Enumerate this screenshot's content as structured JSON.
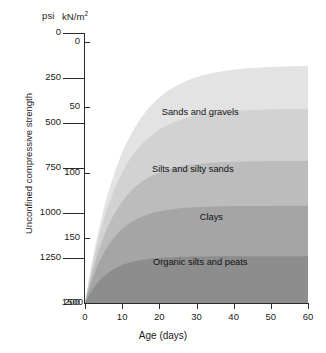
{
  "chart_data": {
    "type": "area",
    "title": "",
    "xlabel": "Age (days)",
    "ylabel": "Unconfined compressive strength",
    "xlim": [
      0,
      60
    ],
    "grid": false,
    "legend_position": "inline-band-labels",
    "x": [
      0,
      10,
      20,
      30,
      40,
      50,
      60
    ],
    "axes": [
      {
        "name": "psi",
        "unit_label": "psi",
        "side": "outer-left",
        "ticks": [
          0,
          250,
          500,
          750,
          1000,
          1250,
          1500
        ],
        "range": [
          0,
          1500
        ]
      },
      {
        "name": "kN/m2",
        "unit_label": "kN/m",
        "unit_sup": "2",
        "side": "inner-left",
        "ticks": [
          0,
          50,
          100,
          150,
          200
        ],
        "range": [
          0,
          207
        ]
      }
    ],
    "xticks": [
      0,
      10,
      20,
      30,
      40,
      50,
      60
    ],
    "series": [
      {
        "name": "Organic silts and peats",
        "label": "Organic silts and peats",
        "color": "#8d8d8d",
        "plateau_psi": 260,
        "tau_days": 6,
        "values": [
          0,
          212,
          252,
          259,
          260,
          260,
          260
        ]
      },
      {
        "name": "Clays",
        "label": "Clays",
        "color": "#a5a5a5",
        "plateau_psi": 540,
        "tau_days": 7,
        "values": [
          0,
          407,
          508,
          533,
          539,
          540,
          540
        ]
      },
      {
        "name": "Silts and silty sands",
        "label": "Silts and silty sands",
        "color": "#bcbcbc",
        "plateau_psi": 790,
        "tau_days": 8,
        "values": [
          0,
          563,
          725,
          772,
          786,
          789,
          790
        ]
      },
      {
        "name": "Sands and gravels",
        "label": "Sands and gravels",
        "color": "#d2d2d2",
        "plateau_psi": 1080,
        "tau_days": 9,
        "values": [
          0,
          724,
          964,
          1037,
          1062,
          1072,
          1076
        ]
      },
      {
        "name": "upper-envelope",
        "label": "",
        "color": "#e3e3e3",
        "plateau_psi": 1320,
        "tau_days": 10,
        "values": [
          0,
          835,
          1142,
          1254,
          1296,
          1311,
          1317
        ]
      }
    ],
    "band_labels": [
      {
        "text": "Sands and gravels",
        "x_days": 31,
        "y_psi": 1055
      },
      {
        "text": "Silts and silty sands",
        "x_days": 29,
        "y_psi": 740
      },
      {
        "text": "Clays",
        "x_days": 34,
        "y_psi": 470
      },
      {
        "text": "Organic silts and peats",
        "x_days": 31,
        "y_psi": 225
      }
    ]
  },
  "figure": {
    "psi_header": "psi",
    "kn_header": "kN/m",
    "kn_header_sup": "2",
    "ylabel": "Unconfined compressive strength",
    "xlabel": "Age (days)",
    "psi_ticks": [
      "1500",
      "1250",
      "1000",
      "750",
      "500",
      "250",
      "0"
    ],
    "kn_ticks": [
      "200",
      "150",
      "100",
      "50",
      "0"
    ],
    "x_ticks": [
      "0",
      "10",
      "20",
      "30",
      "40",
      "50",
      "60"
    ],
    "band_label_0": "Sands and gravels",
    "band_label_1": "Silts and silty sands",
    "band_label_2": "Clays",
    "band_label_3": "Organic silts and peats"
  },
  "colors": {
    "axis": "#2a2a2a",
    "text": "#1b1b1b",
    "background": "#ffffff",
    "band_top": "#e3e3e3",
    "band_sands": "#d2d2d2",
    "band_silts": "#bcbcbc",
    "band_clays": "#a5a5a5",
    "band_organic": "#8d8d8d"
  }
}
